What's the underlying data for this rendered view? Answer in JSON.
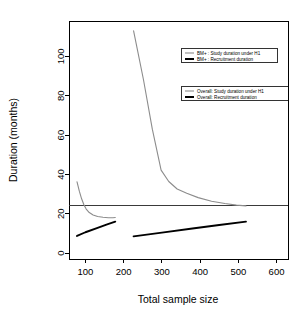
{
  "chart_data": {
    "type": "line",
    "title": "",
    "xlabel": "Total sample size",
    "ylabel": "Duration (months)",
    "xlim": [
      57,
      630
    ],
    "ylim": [
      -3,
      118
    ],
    "xticks": [
      100,
      200,
      300,
      400,
      500,
      600
    ],
    "yticks": [
      0,
      20,
      40,
      60,
      80,
      100
    ],
    "grid": false,
    "reference_lines": [
      {
        "name": "target-duration",
        "axis": "y",
        "value": 24,
        "color": "#3a3a3a"
      }
    ],
    "series": [
      {
        "name": "BM+ : Study duration under H1",
        "key": "bmplus-study",
        "color": "#8c8c8c",
        "width": 1.1,
        "points": [
          [
            78,
            36.2
          ],
          [
            84,
            31.5
          ],
          [
            90,
            27.6
          ],
          [
            96,
            24.6
          ],
          [
            102,
            22.4
          ],
          [
            110,
            20.6
          ],
          [
            120,
            19.4
          ],
          [
            132,
            18.6
          ],
          [
            146,
            18.2
          ],
          [
            160,
            18.0
          ],
          [
            172,
            18.0
          ],
          [
            178,
            18.1
          ]
        ]
      },
      {
        "name": "BM+ : Recruitment duration",
        "key": "bmplus-recruit",
        "color": "#000000",
        "width": 1.9,
        "points": [
          [
            78,
            8.7
          ],
          [
            100,
            10.6
          ],
          [
            130,
            12.7
          ],
          [
            155,
            14.5
          ],
          [
            178,
            16.0
          ]
        ]
      },
      {
        "name": "Overall: Study duration under H1",
        "key": "overall-study",
        "color": "#8c8c8c",
        "width": 1.1,
        "points": [
          [
            226,
            113.0
          ],
          [
            252,
            88.0
          ],
          [
            275,
            63.0
          ],
          [
            298,
            42.2
          ],
          [
            318,
            36.4
          ],
          [
            340,
            32.6
          ],
          [
            365,
            30.4
          ],
          [
            395,
            28.2
          ],
          [
            430,
            26.4
          ],
          [
            465,
            25.2
          ],
          [
            495,
            24.4
          ],
          [
            520,
            24.0
          ]
        ]
      },
      {
        "name": "Overall: Recruitment duration",
        "key": "overall-recruit",
        "color": "#000000",
        "width": 1.9,
        "points": [
          [
            226,
            8.5
          ],
          [
            300,
            10.4
          ],
          [
            380,
            12.5
          ],
          [
            450,
            14.3
          ],
          [
            520,
            16.0
          ]
        ]
      }
    ],
    "legends": [
      {
        "key": "legend-bmplus",
        "entries": [
          {
            "label": "BM+ : Study duration under H1",
            "style": "study"
          },
          {
            "label": "BM+ : Recruitment duration",
            "style": "recruit"
          }
        ]
      },
      {
        "key": "legend-overall",
        "entries": [
          {
            "label": "Overall: Study duration under H1",
            "style": "study"
          },
          {
            "label": "Overall: Recruitment duration",
            "style": "recruit"
          }
        ]
      }
    ]
  }
}
